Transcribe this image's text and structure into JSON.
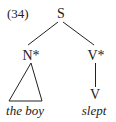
{
  "example_number": "(34)",
  "tree": {
    "root": "S",
    "left_branch": {
      "label": "N*",
      "terminal_style": "triangle",
      "leaf": "the boy"
    },
    "right_branch": {
      "label": "V*",
      "child": "V",
      "leaf": "slept"
    }
  },
  "colors": {
    "ink": "#222222",
    "background": "#ffffff"
  }
}
